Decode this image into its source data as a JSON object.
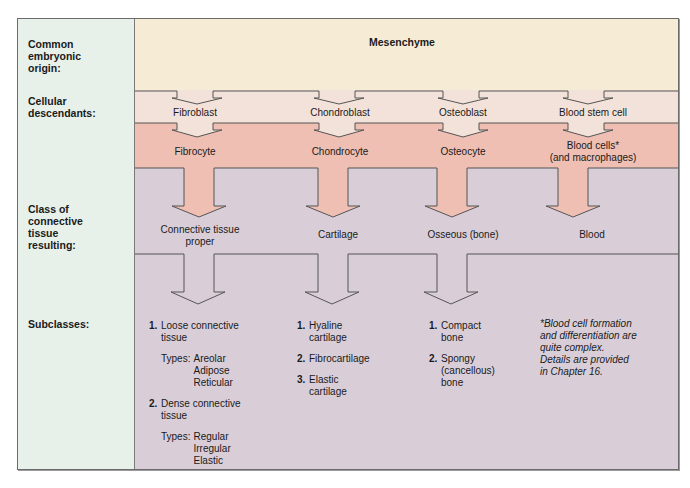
{
  "row_labels": {
    "origin": "Common\nembryonic\norigin:",
    "descendants": "Cellular\ndescendants:",
    "class": "Class of\nconnective\ntissue\nresulting:",
    "subclasses": "Subclasses:"
  },
  "origin": {
    "label": "Mesenchyme"
  },
  "columns": [
    {
      "descendant": "Fibroblast",
      "mature_cell": "Fibrocyte",
      "class": "Connective tissue\nproper",
      "subclasses": [
        {
          "num": "1.",
          "label": "Loose connective\ntissue",
          "types_label": "Types:",
          "types": "Areolar\nAdipose\nReticular"
        },
        {
          "num": "2.",
          "label": "Dense connective\ntissue",
          "types_label": "Types:",
          "types": "Regular\nIrregular\nElastic"
        }
      ]
    },
    {
      "descendant": "Chondroblast",
      "mature_cell": "Chondrocyte",
      "class": "Cartilage",
      "subclasses": [
        {
          "num": "1.",
          "label": "Hyaline\ncartilage"
        },
        {
          "num": "2.",
          "label": "Fibrocartilage"
        },
        {
          "num": "3.",
          "label": "Elastic\ncartilage"
        }
      ]
    },
    {
      "descendant": "Osteoblast",
      "mature_cell": "Osteocyte",
      "class": "Osseous (bone)",
      "subclasses": [
        {
          "num": "1.",
          "label": "Compact\nbone"
        },
        {
          "num": "2.",
          "label": "Spongy\n(cancellous)\nbone"
        }
      ]
    },
    {
      "descendant": "Blood stem cell",
      "mature_cell": "Blood cells*\n(and macrophages)",
      "class": "Blood"
    }
  ],
  "footnote": "*Blood cell formation\nand differentiation are\nquite complex.\nDetails are provided\nin Chapter 16.",
  "colors": {
    "origin_band": "#f6ecd6",
    "descendant_band": "#f3e2d9",
    "cell_band": "#efbfb3",
    "class_band": "#d9ced8",
    "label_column": "#e7f1ea",
    "stroke": "#555555"
  }
}
